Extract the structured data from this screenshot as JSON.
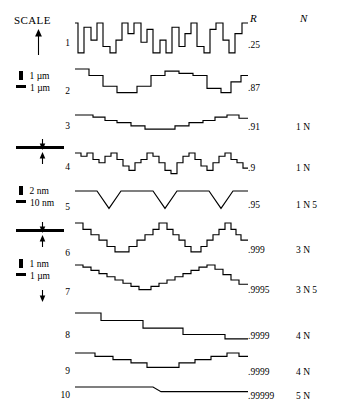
{
  "scale_panel": {
    "title": "SCALE",
    "groups": [
      {
        "id": "g1",
        "vertical_unit": "1 µm",
        "horizontal_unit": "1 µm"
      },
      {
        "id": "g2",
        "vertical_unit": "2  nm",
        "horizontal_unit": "10 nm"
      },
      {
        "id": "g3",
        "vertical_unit": "1  nm",
        "horizontal_unit": "1 µm"
      }
    ]
  },
  "columns": {
    "r_header": "R",
    "n_header": "N"
  },
  "chart_data": {
    "type": "line",
    "title": "",
    "xlabel": "",
    "ylabel": "",
    "grid": false,
    "legend_position": "none",
    "series": [
      {
        "name": "1",
        "label": "1",
        "R": ".25",
        "N": "",
        "style": "step",
        "points": [
          [
            0,
            30
          ],
          [
            3,
            30
          ],
          [
            3,
            2
          ],
          [
            9,
            2
          ],
          [
            9,
            26
          ],
          [
            16,
            26
          ],
          [
            16,
            14
          ],
          [
            22,
            14
          ],
          [
            22,
            30
          ],
          [
            28,
            30
          ],
          [
            28,
            8
          ],
          [
            35,
            8
          ],
          [
            35,
            2
          ],
          [
            41,
            2
          ],
          [
            41,
            14
          ],
          [
            47,
            14
          ],
          [
            47,
            30
          ],
          [
            53,
            30
          ],
          [
            53,
            20
          ],
          [
            59,
            20
          ],
          [
            59,
            30
          ],
          [
            66,
            30
          ],
          [
            66,
            12
          ],
          [
            72,
            12
          ],
          [
            72,
            24
          ],
          [
            78,
            24
          ],
          [
            78,
            2
          ],
          [
            85,
            2
          ],
          [
            85,
            14
          ],
          [
            91,
            14
          ],
          [
            91,
            2
          ],
          [
            97,
            2
          ],
          [
            97,
            26
          ],
          [
            104,
            26
          ],
          [
            104,
            8
          ],
          [
            110,
            8
          ],
          [
            110,
            20
          ],
          [
            116,
            20
          ],
          [
            116,
            30
          ],
          [
            122,
            30
          ],
          [
            122,
            8
          ],
          [
            129,
            8
          ],
          [
            129,
            2
          ],
          [
            135,
            2
          ],
          [
            135,
            24
          ],
          [
            141,
            24
          ],
          [
            141,
            30
          ],
          [
            148,
            30
          ],
          [
            148,
            14
          ],
          [
            154,
            14
          ],
          [
            154,
            2
          ],
          [
            160,
            2
          ],
          [
            160,
            20
          ],
          [
            167,
            20
          ],
          [
            167,
            30
          ],
          [
            173,
            30
          ]
        ]
      },
      {
        "name": "2",
        "label": "2",
        "R": ".87",
        "N": "",
        "style": "step",
        "points": [
          [
            0,
            26
          ],
          [
            14,
            26
          ],
          [
            14,
            20
          ],
          [
            28,
            20
          ],
          [
            28,
            10
          ],
          [
            42,
            10
          ],
          [
            42,
            4
          ],
          [
            62,
            4
          ],
          [
            62,
            10
          ],
          [
            76,
            10
          ],
          [
            76,
            20
          ],
          [
            90,
            20
          ],
          [
            90,
            24
          ],
          [
            104,
            24
          ],
          [
            104,
            22
          ],
          [
            118,
            22
          ],
          [
            118,
            20
          ],
          [
            132,
            20
          ],
          [
            132,
            8
          ],
          [
            146,
            8
          ],
          [
            146,
            4
          ],
          [
            156,
            4
          ],
          [
            156,
            14
          ],
          [
            166,
            14
          ],
          [
            166,
            20
          ],
          [
            173,
            20
          ]
        ]
      },
      {
        "name": "3",
        "label": "3",
        "R": ".91",
        "N": "1 N",
        "style": "step",
        "points": [
          [
            0,
            22
          ],
          [
            18,
            22
          ],
          [
            18,
            20
          ],
          [
            30,
            20
          ],
          [
            30,
            17
          ],
          [
            42,
            17
          ],
          [
            42,
            15
          ],
          [
            56,
            15
          ],
          [
            56,
            12
          ],
          [
            70,
            12
          ],
          [
            70,
            9
          ],
          [
            86,
            9
          ],
          [
            86,
            9
          ],
          [
            100,
            9
          ],
          [
            100,
            12
          ],
          [
            114,
            12
          ],
          [
            114,
            15
          ],
          [
            128,
            15
          ],
          [
            128,
            17
          ],
          [
            140,
            17
          ],
          [
            140,
            20
          ],
          [
            152,
            20
          ],
          [
            152,
            22
          ],
          [
            164,
            22
          ],
          [
            164,
            19
          ],
          [
            173,
            19
          ]
        ]
      },
      {
        "name": "4",
        "label": "4",
        "R": ".9",
        "N": "1 N",
        "style": "step",
        "points": [
          [
            0,
            24
          ],
          [
            6,
            24
          ],
          [
            6,
            21
          ],
          [
            12,
            21
          ],
          [
            12,
            24
          ],
          [
            18,
            24
          ],
          [
            18,
            18
          ],
          [
            24,
            18
          ],
          [
            24,
            15
          ],
          [
            30,
            15
          ],
          [
            30,
            21
          ],
          [
            36,
            21
          ],
          [
            36,
            24
          ],
          [
            42,
            24
          ],
          [
            42,
            18
          ],
          [
            48,
            18
          ],
          [
            48,
            12
          ],
          [
            54,
            12
          ],
          [
            54,
            8
          ],
          [
            60,
            8
          ],
          [
            60,
            15
          ],
          [
            66,
            15
          ],
          [
            66,
            18
          ],
          [
            72,
            18
          ],
          [
            72,
            24
          ],
          [
            78,
            24
          ],
          [
            78,
            21
          ],
          [
            84,
            21
          ],
          [
            84,
            15
          ],
          [
            90,
            15
          ],
          [
            90,
            8
          ],
          [
            96,
            8
          ],
          [
            96,
            5
          ],
          [
            102,
            5
          ],
          [
            102,
            15
          ],
          [
            108,
            15
          ],
          [
            108,
            21
          ],
          [
            114,
            21
          ],
          [
            114,
            24
          ],
          [
            120,
            24
          ],
          [
            120,
            18
          ],
          [
            126,
            18
          ],
          [
            126,
            12
          ],
          [
            132,
            12
          ],
          [
            132,
            8
          ],
          [
            138,
            8
          ],
          [
            138,
            15
          ],
          [
            144,
            15
          ],
          [
            144,
            21
          ],
          [
            150,
            21
          ],
          [
            150,
            24
          ],
          [
            156,
            24
          ],
          [
            156,
            18
          ],
          [
            162,
            18
          ],
          [
            162,
            15
          ],
          [
            168,
            15
          ],
          [
            168,
            10
          ],
          [
            173,
            10
          ]
        ]
      },
      {
        "name": "5",
        "label": "5",
        "R": ".95",
        "N": "1 N 5",
        "style": "linear",
        "points": [
          [
            0,
            19
          ],
          [
            22,
            19
          ],
          [
            34,
            4
          ],
          [
            46,
            19
          ],
          [
            78,
            19
          ],
          [
            90,
            4
          ],
          [
            102,
            19
          ],
          [
            134,
            19
          ],
          [
            146,
            4
          ],
          [
            158,
            19
          ],
          [
            173,
            19
          ]
        ]
      },
      {
        "name": "6",
        "label": "6",
        "R": ".999",
        "N": "3 N",
        "style": "step",
        "points": [
          [
            0,
            30
          ],
          [
            8,
            30
          ],
          [
            8,
            24
          ],
          [
            16,
            24
          ],
          [
            16,
            19
          ],
          [
            24,
            19
          ],
          [
            24,
            14
          ],
          [
            32,
            14
          ],
          [
            32,
            8
          ],
          [
            40,
            8
          ],
          [
            40,
            3
          ],
          [
            54,
            3
          ],
          [
            54,
            8
          ],
          [
            62,
            8
          ],
          [
            62,
            14
          ],
          [
            70,
            14
          ],
          [
            70,
            19
          ],
          [
            78,
            19
          ],
          [
            78,
            24
          ],
          [
            84,
            24
          ],
          [
            84,
            30
          ],
          [
            92,
            30
          ],
          [
            92,
            24
          ],
          [
            98,
            24
          ],
          [
            98,
            19
          ],
          [
            104,
            19
          ],
          [
            104,
            14
          ],
          [
            110,
            14
          ],
          [
            110,
            8
          ],
          [
            116,
            8
          ],
          [
            116,
            3
          ],
          [
            126,
            3
          ],
          [
            126,
            8
          ],
          [
            132,
            8
          ],
          [
            132,
            14
          ],
          [
            138,
            14
          ],
          [
            138,
            19
          ],
          [
            144,
            19
          ],
          [
            144,
            24
          ],
          [
            150,
            24
          ],
          [
            150,
            30
          ],
          [
            156,
            30
          ],
          [
            156,
            24
          ],
          [
            161,
            24
          ],
          [
            161,
            19
          ],
          [
            166,
            19
          ],
          [
            166,
            14
          ],
          [
            173,
            14
          ]
        ]
      },
      {
        "name": "7",
        "label": "7",
        "R": ".9995",
        "N": "3 N 5",
        "style": "step",
        "points": [
          [
            0,
            28
          ],
          [
            8,
            28
          ],
          [
            8,
            26
          ],
          [
            16,
            26
          ],
          [
            16,
            23
          ],
          [
            24,
            23
          ],
          [
            24,
            20
          ],
          [
            32,
            20
          ],
          [
            32,
            17
          ],
          [
            40,
            17
          ],
          [
            40,
            14
          ],
          [
            48,
            14
          ],
          [
            48,
            11
          ],
          [
            56,
            11
          ],
          [
            56,
            8
          ],
          [
            64,
            8
          ],
          [
            64,
            5
          ],
          [
            76,
            5
          ],
          [
            76,
            8
          ],
          [
            84,
            8
          ],
          [
            84,
            11
          ],
          [
            92,
            11
          ],
          [
            92,
            14
          ],
          [
            100,
            14
          ],
          [
            100,
            17
          ],
          [
            108,
            17
          ],
          [
            108,
            20
          ],
          [
            116,
            20
          ],
          [
            116,
            23
          ],
          [
            124,
            23
          ],
          [
            124,
            26
          ],
          [
            132,
            26
          ],
          [
            132,
            28
          ],
          [
            140,
            28
          ],
          [
            140,
            24
          ],
          [
            148,
            24
          ],
          [
            148,
            19
          ],
          [
            156,
            19
          ],
          [
            156,
            14
          ],
          [
            164,
            14
          ],
          [
            164,
            10
          ],
          [
            173,
            10
          ]
        ]
      },
      {
        "name": "8",
        "label": "8",
        "R": ".9999",
        "N": "4 N",
        "style": "step",
        "points": [
          [
            0,
            26
          ],
          [
            26,
            26
          ],
          [
            26,
            19
          ],
          [
            68,
            19
          ],
          [
            68,
            12
          ],
          [
            108,
            12
          ],
          [
            108,
            6
          ],
          [
            150,
            6
          ],
          [
            150,
            2
          ],
          [
            173,
            2
          ]
        ]
      },
      {
        "name": "9",
        "label": "9",
        "R": ".9999",
        "N": "4 N",
        "style": "step",
        "points": [
          [
            0,
            20
          ],
          [
            20,
            20
          ],
          [
            20,
            17
          ],
          [
            38,
            17
          ],
          [
            38,
            14
          ],
          [
            56,
            14
          ],
          [
            56,
            11
          ],
          [
            72,
            11
          ],
          [
            72,
            7
          ],
          [
            90,
            7
          ],
          [
            90,
            7
          ],
          [
            104,
            7
          ],
          [
            104,
            11
          ],
          [
            120,
            11
          ],
          [
            120,
            14
          ],
          [
            136,
            14
          ],
          [
            136,
            17
          ],
          [
            152,
            17
          ],
          [
            152,
            20
          ],
          [
            164,
            20
          ],
          [
            164,
            17
          ],
          [
            173,
            17
          ]
        ]
      },
      {
        "name": "10",
        "label": "10",
        "R": ".99999",
        "N": "5 N",
        "style": "linear",
        "points": [
          [
            0,
            12
          ],
          [
            78,
            12
          ],
          [
            86,
            8
          ],
          [
            173,
            8
          ]
        ]
      }
    ]
  }
}
